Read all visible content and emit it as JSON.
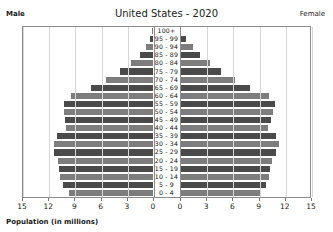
{
  "header": {
    "title": "United States - 2020",
    "male_label": "Male",
    "female_label": "Female"
  },
  "axis": {
    "caption": "Population (in millions)",
    "tick_labels_left": [
      "15",
      "12",
      "9",
      "6",
      "3",
      "0"
    ],
    "tick_labels_right": [
      "0",
      "3",
      "6",
      "9",
      "12",
      "15"
    ]
  },
  "colors": {
    "bar_dark": "#4a4a4a",
    "bar_light": "#7d7d7d",
    "frame": "#8c8c8c",
    "grid": "#d8d8d8",
    "background": "#ffffff"
  },
  "chart_data": {
    "type": "bar",
    "subtype": "population-pyramid",
    "title": "United States - 2020",
    "xlabel": "Population (in millions)",
    "ylabel": "",
    "xlim": [
      0,
      15
    ],
    "xticks": [
      0,
      3,
      6,
      9,
      12,
      15
    ],
    "grid": true,
    "legend_position": "top-corners",
    "categories": [
      "100+",
      "95 - 99",
      "90 - 94",
      "85 - 89",
      "80 - 84",
      "75 - 79",
      "70 - 74",
      "65 - 69",
      "60 - 64",
      "55 - 59",
      "50 - 54",
      "45 - 49",
      "40 - 44",
      "35 - 39",
      "30 - 34",
      "25 - 29",
      "20 - 24",
      "15 - 19",
      "10 - 14",
      "5 - 9",
      "0 - 4"
    ],
    "series": [
      {
        "name": "Male",
        "side": "left",
        "values": [
          0.08,
          0.35,
          0.82,
          1.55,
          2.55,
          3.75,
          5.45,
          7.15,
          9.35,
          10.2,
          10.15,
          10.1,
          10.0,
          11.0,
          11.4,
          11.3,
          10.9,
          10.8,
          10.7,
          10.3,
          9.6
        ]
      },
      {
        "name": "Female",
        "side": "right",
        "values": [
          0.18,
          0.72,
          1.45,
          2.35,
          3.45,
          4.65,
          6.35,
          8.0,
          10.2,
          10.9,
          10.7,
          10.4,
          10.1,
          11.0,
          11.3,
          11.0,
          10.5,
          10.3,
          10.25,
          9.9,
          9.2
        ]
      }
    ]
  }
}
